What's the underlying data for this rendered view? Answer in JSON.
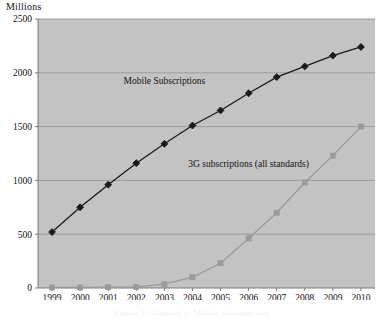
{
  "chart_data": {
    "type": "line",
    "title": "",
    "ylabel": "Millions",
    "xlabel": "",
    "ylim": [
      0,
      2500
    ],
    "yticks": [
      0,
      500,
      1000,
      1500,
      2000,
      2500
    ],
    "grid": true,
    "legend_position": "inline-annotations",
    "categories": [
      "1999",
      "2000",
      "2001",
      "2002",
      "2003",
      "2004",
      "2005",
      "2006",
      "2007",
      "2008",
      "2009",
      "2010"
    ],
    "series": [
      {
        "name": "Mobile Subscriptions",
        "color": "#1a1a1a",
        "marker": "diamond",
        "values": [
          520,
          750,
          960,
          1160,
          1340,
          1510,
          1650,
          1810,
          1960,
          2060,
          2160,
          2240
        ]
      },
      {
        "name": "3G subscriptions (all standards)",
        "color": "#9a9a9a",
        "marker": "square",
        "values": [
          5,
          5,
          8,
          10,
          35,
          100,
          230,
          460,
          700,
          980,
          1230,
          1500
        ]
      }
    ],
    "annotations": [
      {
        "text": "Mobile Subscriptions",
        "x_category": "2003",
        "y_value": 1900
      },
      {
        "text": "3G subscriptions (all standards)",
        "x_category": "2006",
        "y_value": 1120
      }
    ],
    "plot_background": "#c3c3c3",
    "figure_background": "#ffffff"
  },
  "caption": {
    "text": "Figure 1.1   Growth of Mobile Subscriptions"
  }
}
